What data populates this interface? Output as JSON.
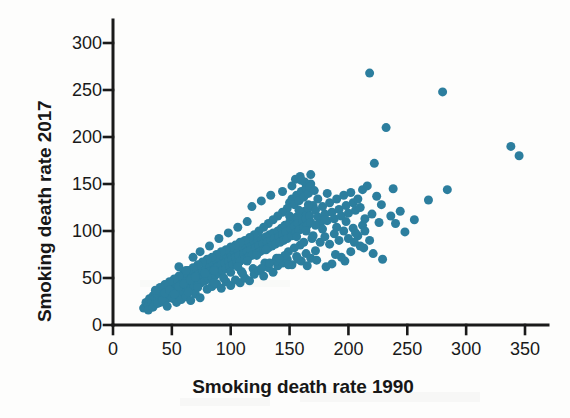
{
  "chart_data": {
    "type": "scatter",
    "title": "",
    "xlabel": "Smoking death rate 1990",
    "ylabel": "Smoking death rate 2017",
    "xlim": [
      0,
      365
    ],
    "ylim": [
      0,
      310
    ],
    "xticks": [
      0,
      50,
      100,
      150,
      200,
      250,
      300,
      350
    ],
    "yticks": [
      0,
      50,
      100,
      150,
      200,
      250,
      300
    ],
    "xtick_labels": [
      "0",
      "50",
      "100",
      "150",
      "200",
      "250",
      "300",
      "350"
    ],
    "ytick_labels": [
      "0",
      "50",
      "100",
      "150",
      "200",
      "250",
      "300"
    ],
    "grid": false,
    "legend": null,
    "marker_color": "#2C7E9E",
    "marker_size": 9,
    "axis_color": "#1a1a1a",
    "background": "#fdfdfc",
    "points": [
      [
        26,
        18
      ],
      [
        28,
        24
      ],
      [
        30,
        21
      ],
      [
        31,
        28
      ],
      [
        33,
        25
      ],
      [
        34,
        31
      ],
      [
        35,
        22
      ],
      [
        36,
        29
      ],
      [
        37,
        34
      ],
      [
        38,
        27
      ],
      [
        39,
        32
      ],
      [
        40,
        24
      ],
      [
        41,
        36
      ],
      [
        42,
        30
      ],
      [
        43,
        33
      ],
      [
        44,
        27
      ],
      [
        45,
        38
      ],
      [
        46,
        31
      ],
      [
        47,
        35
      ],
      [
        48,
        29
      ],
      [
        49,
        40
      ],
      [
        50,
        34
      ],
      [
        51,
        28
      ],
      [
        52,
        42
      ],
      [
        53,
        36
      ],
      [
        54,
        31
      ],
      [
        55,
        44
      ],
      [
        56,
        38
      ],
      [
        57,
        33
      ],
      [
        58,
        46
      ],
      [
        59,
        40
      ],
      [
        60,
        35
      ],
      [
        61,
        48
      ],
      [
        62,
        42
      ],
      [
        63,
        37
      ],
      [
        64,
        50
      ],
      [
        65,
        44
      ],
      [
        66,
        39
      ],
      [
        67,
        52
      ],
      [
        68,
        46
      ],
      [
        69,
        41
      ],
      [
        70,
        54
      ],
      [
        71,
        48
      ],
      [
        72,
        43
      ],
      [
        73,
        56
      ],
      [
        74,
        50
      ],
      [
        75,
        45
      ],
      [
        76,
        58
      ],
      [
        77,
        52
      ],
      [
        54,
        24
      ],
      [
        58,
        27
      ],
      [
        62,
        30
      ],
      [
        66,
        26
      ],
      [
        70,
        33
      ],
      [
        74,
        29
      ],
      [
        78,
        47
      ],
      [
        79,
        60
      ],
      [
        80,
        54
      ],
      [
        81,
        49
      ],
      [
        82,
        63
      ],
      [
        83,
        57
      ],
      [
        84,
        51
      ],
      [
        85,
        66
      ],
      [
        86,
        59
      ],
      [
        87,
        53
      ],
      [
        88,
        68
      ],
      [
        89,
        62
      ],
      [
        90,
        55
      ],
      [
        91,
        70
      ],
      [
        92,
        64
      ],
      [
        93,
        58
      ],
      [
        94,
        72
      ],
      [
        95,
        66
      ],
      [
        96,
        60
      ],
      [
        97,
        74
      ],
      [
        98,
        68
      ],
      [
        99,
        62
      ],
      [
        100,
        76
      ],
      [
        101,
        70
      ],
      [
        102,
        64
      ],
      [
        103,
        78
      ],
      [
        104,
        72
      ],
      [
        105,
        66
      ],
      [
        106,
        80
      ],
      [
        107,
        74
      ],
      [
        108,
        68
      ],
      [
        109,
        57
      ],
      [
        110,
        82
      ],
      [
        80,
        38
      ],
      [
        84,
        41
      ],
      [
        88,
        44
      ],
      [
        92,
        39
      ],
      [
        96,
        46
      ],
      [
        100,
        42
      ],
      [
        104,
        48
      ],
      [
        108,
        45
      ],
      [
        112,
        50
      ],
      [
        116,
        47
      ],
      [
        111,
        76
      ],
      [
        112,
        70
      ],
      [
        113,
        84
      ],
      [
        114,
        78
      ],
      [
        115,
        72
      ],
      [
        116,
        86
      ],
      [
        117,
        80
      ],
      [
        118,
        74
      ],
      [
        119,
        60
      ],
      [
        120,
        88
      ],
      [
        121,
        82
      ],
      [
        122,
        76
      ],
      [
        123,
        90
      ],
      [
        124,
        84
      ],
      [
        125,
        78
      ],
      [
        126,
        92
      ],
      [
        127,
        86
      ],
      [
        128,
        80
      ],
      [
        129,
        66
      ],
      [
        130,
        94
      ],
      [
        131,
        88
      ],
      [
        132,
        82
      ],
      [
        133,
        96
      ],
      [
        134,
        90
      ],
      [
        135,
        84
      ],
      [
        136,
        98
      ],
      [
        137,
        92
      ],
      [
        138,
        86
      ],
      [
        139,
        71
      ],
      [
        140,
        100
      ],
      [
        120,
        54
      ],
      [
        124,
        58
      ],
      [
        128,
        52
      ],
      [
        132,
        61
      ],
      [
        136,
        56
      ],
      [
        140,
        63
      ],
      [
        141,
        94
      ],
      [
        142,
        88
      ],
      [
        143,
        103
      ],
      [
        144,
        96
      ],
      [
        145,
        90
      ],
      [
        146,
        106
      ],
      [
        147,
        99
      ],
      [
        148,
        92
      ],
      [
        149,
        78
      ],
      [
        150,
        109
      ],
      [
        151,
        102
      ],
      [
        152,
        95
      ],
      [
        153,
        112
      ],
      [
        154,
        105
      ],
      [
        155,
        98
      ],
      [
        156,
        115
      ],
      [
        157,
        108
      ],
      [
        158,
        101
      ],
      [
        159,
        85
      ],
      [
        160,
        118
      ],
      [
        161,
        110
      ],
      [
        162,
        104
      ],
      [
        163,
        121
      ],
      [
        164,
        113
      ],
      [
        165,
        106
      ],
      [
        166,
        124
      ],
      [
        167,
        116
      ],
      [
        168,
        109
      ],
      [
        169,
        92
      ],
      [
        170,
        127
      ],
      [
        144,
        66
      ],
      [
        148,
        70
      ],
      [
        152,
        64
      ],
      [
        156,
        73
      ],
      [
        160,
        68
      ],
      [
        164,
        76
      ],
      [
        168,
        71
      ],
      [
        172,
        79
      ],
      [
        150,
        130
      ],
      [
        152,
        134
      ],
      [
        154,
        128
      ],
      [
        156,
        138
      ],
      [
        158,
        132
      ],
      [
        160,
        142
      ],
      [
        162,
        136
      ],
      [
        164,
        146
      ],
      [
        166,
        140
      ],
      [
        168,
        150
      ],
      [
        155,
        155
      ],
      [
        159,
        158
      ],
      [
        163,
        152
      ],
      [
        167,
        147
      ],
      [
        171,
        143
      ],
      [
        148,
        124
      ],
      [
        144,
        120
      ],
      [
        140,
        116
      ],
      [
        136,
        112
      ],
      [
        132,
        108
      ],
      [
        128,
        104
      ],
      [
        124,
        100
      ],
      [
        120,
        96
      ],
      [
        116,
        93
      ],
      [
        112,
        90
      ],
      [
        108,
        88
      ],
      [
        104,
        85
      ],
      [
        100,
        83
      ],
      [
        96,
        80
      ],
      [
        92,
        78
      ],
      [
        88,
        75
      ],
      [
        84,
        72
      ],
      [
        80,
        70
      ],
      [
        76,
        67
      ],
      [
        72,
        64
      ],
      [
        68,
        61
      ],
      [
        64,
        58
      ],
      [
        60,
        55
      ],
      [
        56,
        52
      ],
      [
        52,
        49
      ],
      [
        48,
        46
      ],
      [
        44,
        43
      ],
      [
        40,
        40
      ],
      [
        36,
        37
      ],
      [
        172,
        122
      ],
      [
        174,
        115
      ],
      [
        176,
        108
      ],
      [
        178,
        126
      ],
      [
        180,
        118
      ],
      [
        182,
        111
      ],
      [
        184,
        130
      ],
      [
        186,
        120
      ],
      [
        188,
        113
      ],
      [
        190,
        134
      ],
      [
        192,
        123
      ],
      [
        194,
        116
      ],
      [
        196,
        138
      ],
      [
        198,
        127
      ],
      [
        200,
        119
      ],
      [
        202,
        141
      ],
      [
        204,
        130
      ],
      [
        206,
        122
      ],
      [
        176,
        88
      ],
      [
        180,
        94
      ],
      [
        184,
        86
      ],
      [
        188,
        97
      ],
      [
        192,
        90
      ],
      [
        196,
        100
      ],
      [
        200,
        92
      ],
      [
        204,
        103
      ],
      [
        208,
        95
      ],
      [
        212,
        106
      ],
      [
        208,
        134
      ],
      [
        210,
        125
      ],
      [
        212,
        144
      ],
      [
        214,
        113
      ],
      [
        216,
        148
      ],
      [
        218,
        268
      ],
      [
        220,
        118
      ],
      [
        222,
        172
      ],
      [
        224,
        137
      ],
      [
        226,
        109
      ],
      [
        228,
        128
      ],
      [
        232,
        210
      ],
      [
        236,
        116
      ],
      [
        240,
        108
      ],
      [
        244,
        121
      ],
      [
        238,
        145
      ],
      [
        248,
        99
      ],
      [
        256,
        112
      ],
      [
        268,
        133
      ],
      [
        280,
        248
      ],
      [
        284,
        144
      ],
      [
        338,
        190
      ],
      [
        345,
        180
      ],
      [
        30,
        16
      ],
      [
        34,
        19
      ],
      [
        38,
        23
      ],
      [
        42,
        26
      ],
      [
        46,
        20
      ],
      [
        50,
        30
      ],
      [
        64,
        35
      ],
      [
        72,
        40
      ],
      [
        86,
        45
      ],
      [
        94,
        50
      ],
      [
        110,
        55
      ],
      [
        126,
        60
      ],
      [
        138,
        68
      ],
      [
        146,
        74
      ],
      [
        154,
        82
      ],
      [
        162,
        88
      ],
      [
        170,
        95
      ],
      [
        178,
        102
      ],
      [
        186,
        65
      ],
      [
        194,
        72
      ],
      [
        202,
        78
      ],
      [
        210,
        84
      ],
      [
        218,
        90
      ],
      [
        144,
        142
      ],
      [
        152,
        148
      ],
      [
        160,
        154
      ],
      [
        168,
        160
      ],
      [
        150,
        116
      ],
      [
        158,
        122
      ],
      [
        166,
        128
      ],
      [
        174,
        134
      ],
      [
        182,
        140
      ],
      [
        100,
        56
      ],
      [
        106,
        62
      ],
      [
        114,
        68
      ],
      [
        122,
        74
      ],
      [
        130,
        80
      ],
      [
        56,
        62
      ],
      [
        62,
        58
      ],
      [
        68,
        72
      ],
      [
        74,
        78
      ],
      [
        82,
        84
      ],
      [
        90,
        92
      ],
      [
        98,
        98
      ],
      [
        106,
        104
      ],
      [
        114,
        110
      ],
      [
        133,
        66
      ],
      [
        141,
        71
      ],
      [
        149,
        64
      ],
      [
        157,
        70
      ],
      [
        165,
        63
      ],
      [
        173,
        69
      ],
      [
        181,
        62
      ],
      [
        189,
        75
      ],
      [
        197,
        68
      ],
      [
        205,
        88
      ],
      [
        213,
        82
      ],
      [
        221,
        76
      ],
      [
        229,
        70
      ],
      [
        118,
        126
      ],
      [
        126,
        132
      ],
      [
        134,
        138
      ],
      [
        44,
        34
      ],
      [
        48,
        37
      ],
      [
        52,
        33
      ],
      [
        56,
        41
      ],
      [
        60,
        44
      ],
      [
        66,
        48
      ],
      [
        70,
        51
      ],
      [
        78,
        55
      ],
      [
        86,
        58
      ],
      [
        190,
        104
      ],
      [
        198,
        110
      ],
      [
        206,
        98
      ],
      [
        214,
        100
      ],
      [
        156,
        94
      ],
      [
        164,
        100
      ],
      [
        172,
        106
      ],
      [
        180,
        112
      ]
    ]
  },
  "axis": {
    "y_title": "Smoking death rate 2017",
    "x_title": "Smoking death rate 1990"
  }
}
